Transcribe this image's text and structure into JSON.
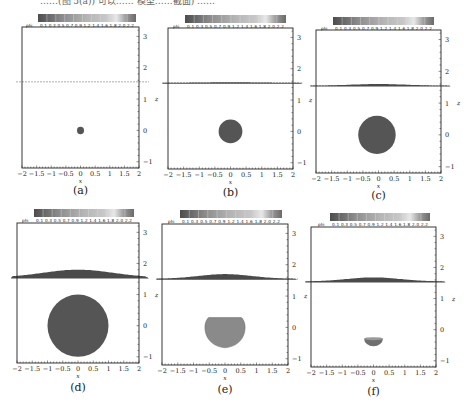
{
  "figure_header_text": "……(图 5(a)) 可以…… 模型……截面) ……",
  "chart_data": [
    {
      "type": "heatmap",
      "panel": "(a)",
      "title": "",
      "xlabel": "x",
      "ylabel": "z",
      "xlim": [
        -2,
        2
      ],
      "ylim": [
        -1.2,
        3.3
      ],
      "x_ticks": [
        "−2",
        "−1.5",
        "−1",
        "−0.5",
        "0",
        "0.5",
        "1",
        "1.5",
        "2"
      ],
      "y_ticks": [
        "−1",
        "0",
        "1",
        "2",
        "3"
      ],
      "colorbar": {
        "label": "phi",
        "ticks": [
          "0.1",
          "0.3",
          "0.5",
          "0.7",
          "0.9",
          "1.2",
          "1.4",
          "1.6",
          "1.8",
          "2.0",
          "2.2"
        ]
      },
      "free_surface_z": 1.55,
      "surface_hump_height": 0.0,
      "bubble": {
        "cx": 0.0,
        "cz": 0.0,
        "rx": 0.12,
        "rz": 0.12,
        "shape": "circle",
        "color": "#555555"
      }
    },
    {
      "type": "heatmap",
      "panel": "(b)",
      "title": "",
      "xlabel": "x",
      "ylabel": "z",
      "xlim": [
        -2,
        2
      ],
      "ylim": [
        -1.2,
        3.3
      ],
      "x_ticks": [
        "−2",
        "−1.5",
        "−1",
        "−0.5",
        "0",
        "0.5",
        "1",
        "1.5",
        "2"
      ],
      "y_ticks": [
        "−1",
        "0",
        "1",
        "2",
        "3"
      ],
      "colorbar": {
        "label": "phi",
        "ticks": [
          "0.1",
          "0.3",
          "0.5",
          "0.7",
          "0.9",
          "1.2",
          "1.4",
          "1.6",
          "1.8",
          "2.0",
          "2.2"
        ]
      },
      "free_surface_z": 1.55,
      "surface_hump_height": 0.02,
      "bubble": {
        "cx": 0.0,
        "cz": 0.0,
        "rx": 0.38,
        "rz": 0.38,
        "shape": "circle",
        "color": "#555555"
      }
    },
    {
      "type": "heatmap",
      "panel": "(c)",
      "title": "",
      "xlabel": "x",
      "ylabel": "z",
      "xlim": [
        -2,
        2
      ],
      "ylim": [
        -1.2,
        3.3
      ],
      "x_ticks": [
        "−2",
        "−1.5",
        "−1",
        "−0.5",
        "0",
        "0.5",
        "1",
        "1.5",
        "2"
      ],
      "y_ticks": [
        "−1",
        "0",
        "1",
        "2",
        "3"
      ],
      "colorbar": {
        "label": "phi",
        "ticks": [
          "0.1",
          "0.3",
          "0.5",
          "0.7",
          "0.9",
          "1.2",
          "1.4",
          "1.6",
          "1.8",
          "2.0",
          "2.2"
        ]
      },
      "free_surface_z": 1.55,
      "surface_hump_height": 0.05,
      "bubble": {
        "cx": -0.05,
        "cz": 0.0,
        "rx": 0.6,
        "rz": 0.6,
        "shape": "circle",
        "color": "#555555"
      }
    },
    {
      "type": "heatmap",
      "panel": "(d)",
      "title": "",
      "xlabel": "x",
      "ylabel": "z",
      "xlim": [
        -2,
        2
      ],
      "ylim": [
        -1.2,
        3.3
      ],
      "x_ticks": [
        "−2",
        "−1.5",
        "−1",
        "−0.5",
        "0",
        "0.5",
        "1",
        "1.5",
        "2"
      ],
      "y_ticks": [
        "−1",
        "0",
        "1",
        "2",
        "3"
      ],
      "colorbar": {
        "label": "phi",
        "ticks": [
          "0.1",
          "0.3",
          "0.5",
          "0.7",
          "0.9",
          "1.2",
          "1.4",
          "1.6",
          "1.8",
          "2.0",
          "2.2"
        ]
      },
      "free_surface_z": 1.55,
      "surface_hump_height": 0.25,
      "bubble": {
        "cx": 0.0,
        "cz": 0.0,
        "rx": 1.0,
        "rz": 1.0,
        "shape": "circle",
        "color": "#555555"
      }
    },
    {
      "type": "heatmap",
      "panel": "(e)",
      "title": "",
      "xlabel": "x",
      "ylabel": "z",
      "xlim": [
        -2,
        2
      ],
      "ylim": [
        -1.2,
        3.3
      ],
      "x_ticks": [
        "−2",
        "−1.5",
        "−1",
        "−0.5",
        "0",
        "0.5",
        "1",
        "1.5",
        "2"
      ],
      "y_ticks": [
        "−1",
        "0",
        "1",
        "2",
        "3"
      ],
      "colorbar": {
        "label": "phi",
        "ticks": [
          "0.1",
          "0.3",
          "0.5",
          "0.7",
          "0.9",
          "1.2",
          "1.4",
          "1.6",
          "1.8",
          "2.0",
          "2.2"
        ]
      },
      "free_surface_z": 1.55,
      "surface_hump_height": 0.15,
      "bubble": {
        "cx": 0.0,
        "cz": -0.1,
        "rx": 0.65,
        "rz": 0.55,
        "shape": "collapsing",
        "color": "#8a8a8a"
      }
    },
    {
      "type": "heatmap",
      "panel": "(f)",
      "title": "",
      "xlabel": "x",
      "ylabel": "z",
      "xlim": [
        -2,
        2
      ],
      "ylim": [
        -1.2,
        3.3
      ],
      "x_ticks": [
        "−2",
        "−1.5",
        "−1",
        "−0.5",
        "0",
        "0.5",
        "1",
        "1.5",
        "2"
      ],
      "y_ticks": [
        "−1",
        "0",
        "1",
        "2",
        "3"
      ],
      "colorbar": {
        "label": "phi",
        "ticks": [
          "0.1",
          "0.3",
          "0.5",
          "0.7",
          "0.9",
          "1.2",
          "1.4",
          "1.6",
          "1.8",
          "2.0",
          "2.2"
        ]
      },
      "free_surface_z": 1.55,
      "surface_hump_height": 0.13,
      "bubble": {
        "cx": 0.0,
        "cz": -0.35,
        "rx": 0.3,
        "rz": 0.2,
        "shape": "half",
        "color": "#6f6f6f"
      }
    }
  ],
  "layout": {
    "panels": [
      {
        "id": "a",
        "left": 22,
        "top": 27,
        "width": 117,
        "height": 141,
        "cbar": {
          "x": 38,
          "y": 14,
          "w": 98,
          "h": 8
        },
        "caption_y": 188
      },
      {
        "id": "b",
        "left": 168,
        "top": 28,
        "width": 125,
        "height": 141,
        "cbar": {
          "x": 185,
          "y": 15,
          "w": 101,
          "h": 8
        },
        "caption_y": 190
      },
      {
        "id": "c",
        "left": 316,
        "top": 30,
        "width": 125,
        "height": 143,
        "cbar": {
          "x": 333,
          "y": 17,
          "w": 101,
          "h": 8
        },
        "caption_y": 193
      },
      {
        "id": "d",
        "left": 17,
        "top": 223,
        "width": 122,
        "height": 140,
        "cbar": {
          "x": 34,
          "y": 209,
          "w": 100,
          "h": 8
        },
        "caption_y": 385
      },
      {
        "id": "e",
        "left": 162,
        "top": 224,
        "width": 126,
        "height": 141,
        "cbar": {
          "x": 180,
          "y": 210,
          "w": 102,
          "h": 8
        },
        "caption_y": 387
      },
      {
        "id": "f",
        "left": 311,
        "top": 227,
        "width": 125,
        "height": 140,
        "cbar": {
          "x": 330,
          "y": 213,
          "w": 100,
          "h": 8
        },
        "caption_y": 389
      }
    ],
    "colors": {
      "frame": "#222222",
      "dashed_surface": "#9a9a9a",
      "surface_fill": "#4a4a4a",
      "text": "#222222"
    }
  }
}
